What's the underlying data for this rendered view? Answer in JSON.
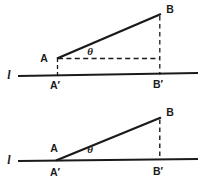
{
  "figure": {
    "background_color": "#ffffff",
    "ink_color": "#1a1a1a",
    "panels": [
      {
        "id": "upper-panel",
        "name": "upper-diagram",
        "description": "Steep angle theta between line l and segment AB",
        "baseline_label": "l",
        "angle_label": "θ",
        "points": [
          {
            "name": "A",
            "label": "A",
            "x": 57,
            "y": 58
          },
          {
            "name": "B",
            "label": "B",
            "x": 160,
            "y": 15
          },
          {
            "name": "A-prime",
            "label": "A′",
            "x": 57,
            "y": 75
          },
          {
            "name": "B-prime",
            "label": "B′",
            "x": 160,
            "y": 75
          }
        ],
        "baseline": {
          "x1": 18,
          "y1": 76,
          "x2": 198,
          "y2": 73
        },
        "segment_AB": {
          "x1": 57,
          "y1": 58,
          "x2": 161,
          "y2": 14
        },
        "dashed_horizontal_from_A": {
          "x1": 57,
          "y1": 58,
          "x2": 160,
          "y2": 58
        },
        "dashed_vertical_A": {
          "x1": 57,
          "y1": 58,
          "x2": 57,
          "y2": 75
        },
        "dashed_vertical_B": {
          "x1": 160,
          "y1": 16,
          "x2": 160,
          "y2": 74
        },
        "label_positions": {
          "A": {
            "x": 44,
            "y": 61
          },
          "B": {
            "x": 166,
            "y": 12
          },
          "A_prime": {
            "x": 48,
            "y": 88
          },
          "B_prime": {
            "x": 152,
            "y": 87
          },
          "line": {
            "x": 7,
            "y": 78
          },
          "theta": {
            "x": 88,
            "y": 54
          }
        }
      },
      {
        "id": "lower-panel",
        "name": "lower-diagram",
        "description": "Shallow angle theta, point A nearly on line l",
        "baseline_label": "l",
        "angle_label": "θ",
        "points": [
          {
            "name": "A",
            "label": "A",
            "x": 57,
            "y": 158
          },
          {
            "name": "B",
            "label": "B",
            "x": 160,
            "y": 118
          },
          {
            "name": "A-prime",
            "label": "A′",
            "x": 57,
            "y": 161
          },
          {
            "name": "B-prime",
            "label": "B′",
            "x": 160,
            "y": 161
          }
        ],
        "baseline": {
          "x1": 18,
          "y1": 161,
          "x2": 198,
          "y2": 159
        },
        "segment_AB": {
          "x1": 56,
          "y1": 160,
          "x2": 161,
          "y2": 117
        },
        "dashed_vertical_B": {
          "x1": 160,
          "y1": 119,
          "x2": 160,
          "y2": 160
        },
        "label_positions": {
          "A": {
            "x": 50,
            "y": 150
          },
          "B": {
            "x": 166,
            "y": 115
          },
          "A_prime": {
            "x": 48,
            "y": 175
          },
          "B_prime": {
            "x": 152,
            "y": 174
          },
          "line": {
            "x": 7,
            "y": 163
          },
          "theta": {
            "x": 88,
            "y": 152
          }
        }
      }
    ]
  }
}
